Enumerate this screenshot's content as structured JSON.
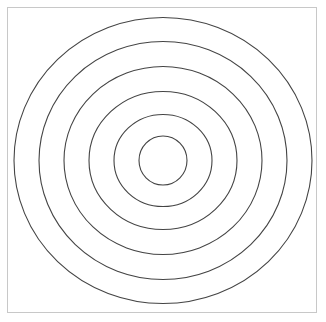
{
  "title": {
    "text": "",
    "note": "clipped"
  },
  "diagram": {
    "type": "concentric-circles",
    "ring_count": 6,
    "center": [
      163,
      160.5
    ],
    "rings": [
      {
        "rx": 149,
        "ry": 143
      },
      {
        "rx": 124,
        "ry": 119
      },
      {
        "rx": 99,
        "ry": 94
      },
      {
        "rx": 74,
        "ry": 69
      },
      {
        "rx": 49,
        "ry": 46
      },
      {
        "rx": 24,
        "ry": 24.5
      }
    ],
    "stroke_color": "#444444",
    "frame_color": "#c8c8c8"
  }
}
